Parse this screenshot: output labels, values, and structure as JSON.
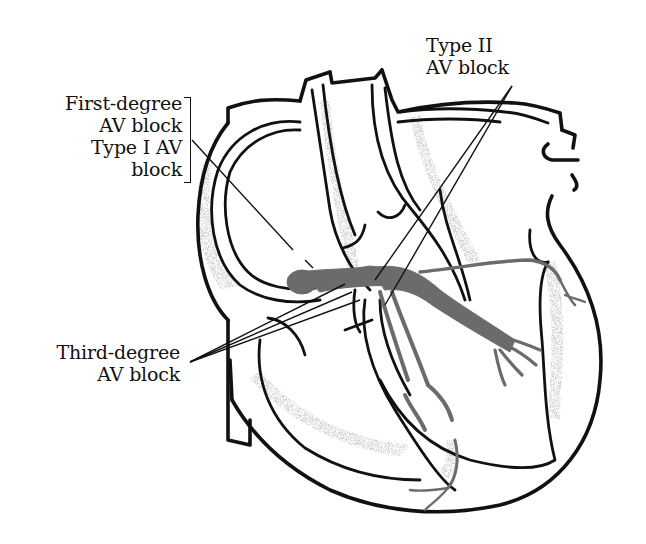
{
  "diagram": {
    "labels": {
      "first_degree": {
        "line1": "First-degree",
        "line2": "AV block"
      },
      "type_one": {
        "line1": "Type I AV",
        "line2": "block"
      },
      "type_two": {
        "line1": "Type II",
        "line2": "AV block"
      },
      "third_degree": {
        "line1": "Third-degree",
        "line2": "AV block"
      }
    },
    "colors": {
      "outline": "#111111",
      "conduction_pathway": "#6b6b6b",
      "stipple": "#9a9a9a",
      "background": "#ffffff"
    }
  }
}
